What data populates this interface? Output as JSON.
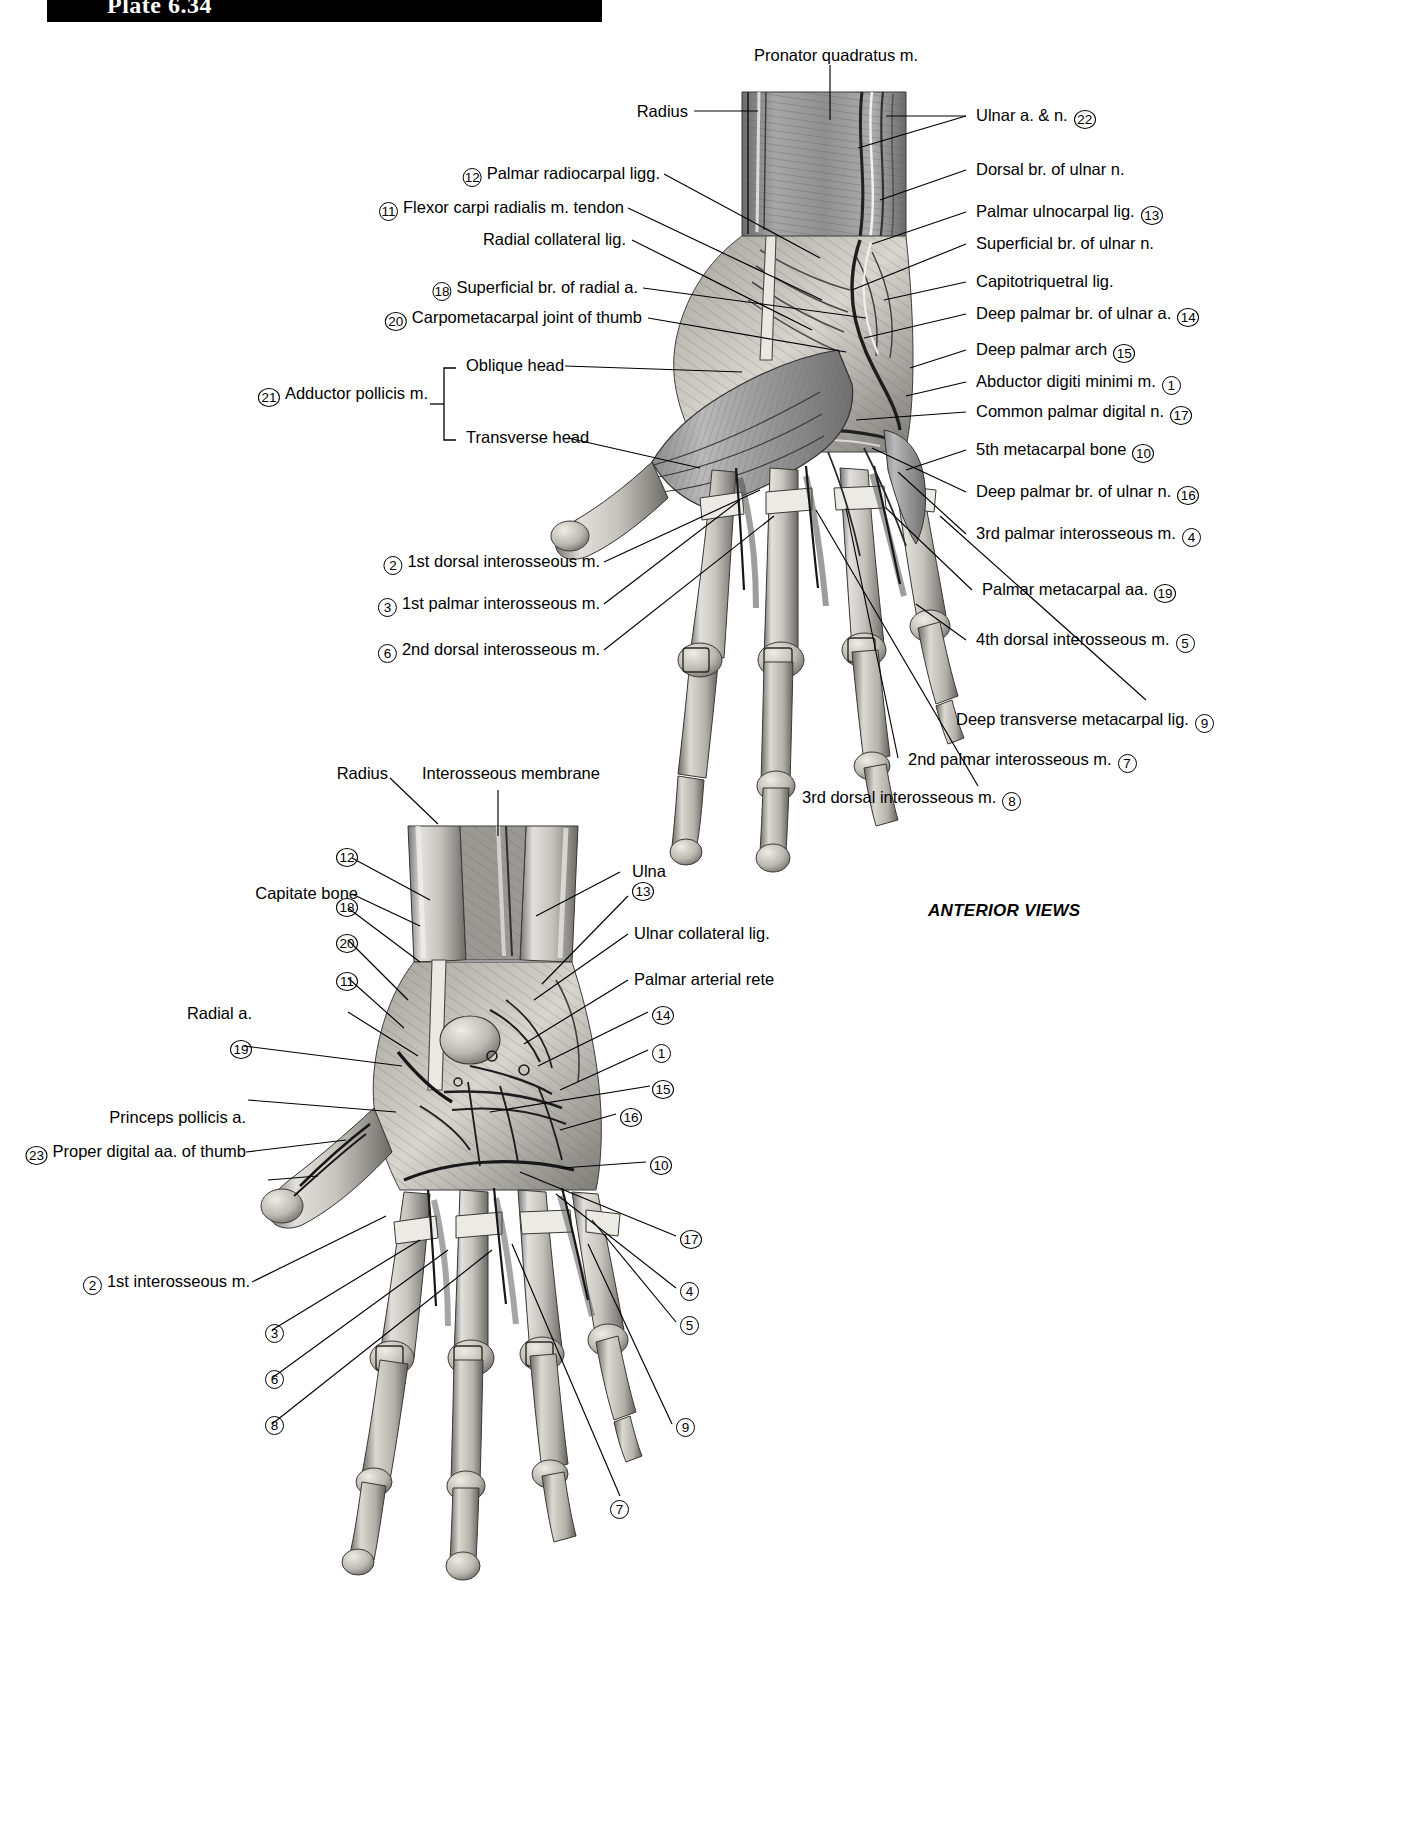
{
  "header": {
    "plate_label": "Plate 6.34"
  },
  "figure_caption": {
    "anterior_views": "ANTERIOR VIEWS"
  },
  "figure_top": {
    "name": "superficial anterior view of wrist and hand",
    "labels_top": [
      {
        "text": "Pronator quadratus m."
      },
      {
        "text": "Radius"
      }
    ],
    "labels_left": [
      {
        "num": "12",
        "text": "Palmar radiocarpal ligg."
      },
      {
        "num": "11",
        "text": "Flexor carpi radialis m. tendon"
      },
      {
        "num": "",
        "text": "Radial collateral lig."
      },
      {
        "num": "18",
        "text": "Superficial br. of radial a."
      },
      {
        "num": "20",
        "text": "Carpometacarpal joint of thumb"
      },
      {
        "num": "21",
        "text": "Adductor pollicis m."
      },
      {
        "num": "",
        "text": "Oblique head"
      },
      {
        "num": "",
        "text": "Transverse head"
      },
      {
        "num": "2",
        "text": "1st dorsal interosseous m."
      },
      {
        "num": "3",
        "text": "1st palmar interosseous m."
      },
      {
        "num": "6",
        "text": "2nd dorsal interosseous m."
      }
    ],
    "labels_right": [
      {
        "text": "Ulnar a. & n.",
        "num": "22"
      },
      {
        "text": "Dorsal br. of ulnar n.",
        "num": ""
      },
      {
        "text": "Palmar ulnocarpal lig.",
        "num": "13"
      },
      {
        "text": "Superficial br. of ulnar n.",
        "num": ""
      },
      {
        "text": "Capitotriquetral lig.",
        "num": ""
      },
      {
        "text": "Deep palmar br. of ulnar a.",
        "num": "14"
      },
      {
        "text": "Deep palmar arch",
        "num": "15"
      },
      {
        "text": "Abductor digiti minimi m.",
        "num": "1"
      },
      {
        "text": "Common palmar digital n.",
        "num": "17"
      },
      {
        "text": "5th metacarpal bone",
        "num": "10"
      },
      {
        "text": "Deep palmar br. of ulnar n.",
        "num": "16"
      },
      {
        "text": "3rd palmar interosseous m.",
        "num": "4"
      },
      {
        "text": "Palmar metacarpal aa.",
        "num": "19"
      },
      {
        "text": "4th dorsal interosseous m.",
        "num": "5"
      },
      {
        "text": "Deep transverse metacarpal lig.",
        "num": "9"
      },
      {
        "text": "2nd palmar interosseous m.",
        "num": "7"
      },
      {
        "text": "3rd dorsal interosseous m.",
        "num": "8"
      }
    ]
  },
  "figure_bottom": {
    "name": "deep anterior view of wrist and hand",
    "labels_top": [
      {
        "text": "Radius"
      },
      {
        "text": "Interosseous membrane"
      }
    ],
    "labels_left": [
      {
        "num": "12",
        "text": ""
      },
      {
        "num": "",
        "text": "Capitate bone"
      },
      {
        "num": "18",
        "text": ""
      },
      {
        "num": "20",
        "text": ""
      },
      {
        "num": "11",
        "text": ""
      },
      {
        "num": "",
        "text": "Radial a."
      },
      {
        "num": "19",
        "text": ""
      },
      {
        "num": "",
        "text": "Princeps pollicis a."
      },
      {
        "num": "23",
        "text": "Proper digital aa. of thumb"
      },
      {
        "num": "2",
        "text": "1st interosseous m."
      },
      {
        "num": "3",
        "text": ""
      },
      {
        "num": "6",
        "text": ""
      },
      {
        "num": "8",
        "text": ""
      }
    ],
    "labels_right": [
      {
        "text": "Ulna",
        "num": ""
      },
      {
        "text": "",
        "num": "13"
      },
      {
        "text": "Ulnar collateral lig.",
        "num": ""
      },
      {
        "text": "Palmar arterial rete",
        "num": ""
      },
      {
        "text": "",
        "num": "14"
      },
      {
        "text": "",
        "num": "1"
      },
      {
        "text": "",
        "num": "15"
      },
      {
        "text": "",
        "num": "16"
      },
      {
        "text": "",
        "num": "10"
      },
      {
        "text": "",
        "num": "17"
      },
      {
        "text": "",
        "num": "4"
      },
      {
        "text": "",
        "num": "5"
      },
      {
        "text": "",
        "num": "9"
      },
      {
        "text": "",
        "num": "7"
      }
    ]
  }
}
